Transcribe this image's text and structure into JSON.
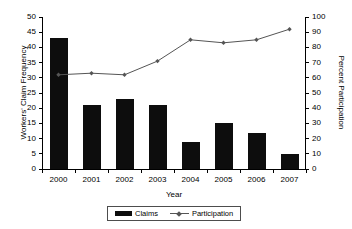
{
  "chart_data": {
    "type": "bar",
    "title": "",
    "xlabel": "Year",
    "ylabel": "Workers' Claim Frequency",
    "y2label": "Percent Participation",
    "categories": [
      "2000",
      "2001",
      "2002",
      "2003",
      "2004",
      "2005",
      "2006",
      "2007"
    ],
    "ylim": [
      0,
      50
    ],
    "y2lim": [
      0,
      100
    ],
    "yticks": [
      0,
      5,
      10,
      15,
      20,
      25,
      30,
      35,
      40,
      45,
      50
    ],
    "y2ticks": [
      0,
      10,
      20,
      30,
      40,
      50,
      60,
      70,
      80,
      90,
      100
    ],
    "grid": false,
    "legend_position": "bottom",
    "series": [
      {
        "name": "Claims",
        "type": "bar",
        "axis": "left",
        "color": "#0d0d0d",
        "values": [
          43,
          21,
          23,
          21,
          9,
          15,
          12,
          5
        ]
      },
      {
        "name": "Participation",
        "type": "line",
        "axis": "right",
        "color": "#555555",
        "marker": "diamond",
        "values": [
          62,
          63,
          62,
          71,
          85,
          83,
          85,
          92
        ]
      }
    ]
  },
  "axes": {
    "left_title": "Workers' Claim Frequency",
    "right_title": "Percent Participation",
    "x_title": "Year"
  },
  "legend": {
    "items": [
      {
        "label": "Claims"
      },
      {
        "label": "Participation"
      }
    ]
  }
}
